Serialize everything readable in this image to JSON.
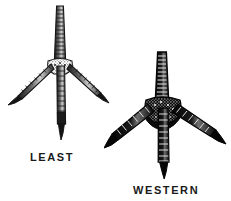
{
  "figure": {
    "background_color": "#ffffff",
    "ink_color": "#141414",
    "width": 231,
    "height": 201,
    "style": "black-and-white scientific line engraving"
  },
  "specimens": [
    {
      "id": "least",
      "label": "LEAST",
      "common_subject": "sandpiper foot",
      "toe_webbing": "unwebbed",
      "rendering": "fine open line work, light shading",
      "ink_color": "#1f1f1f",
      "stroke_width": 1.1,
      "tarsus": {
        "top_x": 56,
        "top_y": 4,
        "bottom_x": 56,
        "bottom_y": 58,
        "top_half_width": 3.2,
        "bottom_half_width": 4.2,
        "scute_count": 13
      },
      "toes": [
        {
          "name": "inner-toe",
          "tip_x": 8,
          "tip_y": 98,
          "mid_x": 30,
          "mid_y": 77,
          "half_width": 2.6,
          "scute_count": 7,
          "claw_length": 9
        },
        {
          "name": "middle-toe",
          "tip_x": 58,
          "tip_y": 132,
          "mid_x": 57,
          "mid_y": 95,
          "half_width": 3.0,
          "scute_count": 11,
          "claw_length": 11
        },
        {
          "name": "outer-toe",
          "tip_x": 100,
          "tip_y": 94,
          "mid_x": 80,
          "mid_y": 75,
          "half_width": 2.6,
          "scute_count": 7,
          "claw_length": 9
        }
      ]
    },
    {
      "id": "western",
      "label": "WESTERN",
      "common_subject": "sandpiper foot",
      "toe_webbing": "partially webbed (semipalmated)",
      "rendering": "heavy solid black mass, dense stippled shading",
      "ink_color": "#080808",
      "stroke_width": 1.4,
      "tarsus": {
        "top_x": 58,
        "top_y": 3,
        "bottom_x": 58,
        "bottom_y": 50,
        "top_half_width": 4.0,
        "bottom_half_width": 5.0,
        "scute_count": 12
      },
      "toes": [
        {
          "name": "inner-toe",
          "tip_x": 4,
          "tip_y": 94,
          "mid_x": 30,
          "mid_y": 75,
          "half_width": 4.2,
          "scute_count": 6,
          "claw_length": 11
        },
        {
          "name": "middle-toe",
          "tip_x": 60,
          "tip_y": 124,
          "mid_x": 59,
          "mid_y": 88,
          "half_width": 4.4,
          "scute_count": 9,
          "claw_length": 12
        },
        {
          "name": "outer-toe",
          "tip_x": 114,
          "tip_y": 90,
          "mid_x": 88,
          "mid_y": 72,
          "half_width": 4.2,
          "scute_count": 6,
          "claw_length": 11
        }
      ],
      "web": {
        "present": true,
        "inner_span": 22,
        "outer_span": 24,
        "depth": 16
      }
    }
  ]
}
